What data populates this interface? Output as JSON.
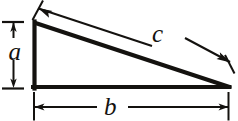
{
  "figure": {
    "kind": "geometry-diagram",
    "shape": "right-triangle",
    "background_color": "#ffffff",
    "ink_color": "#14120f",
    "labels": {
      "leg_vertical": "a",
      "leg_horizontal": "b",
      "hypotenuse": "c"
    },
    "dimension_lines": [
      {
        "name": "a-dimension",
        "label": "a",
        "orientation": "vertical",
        "arrowheads": "both-ends",
        "side": "left"
      },
      {
        "name": "b-dimension",
        "label": "b",
        "orientation": "horizontal",
        "arrowheads": "both-ends",
        "side": "bottom"
      },
      {
        "name": "c-dimension",
        "label": "c",
        "orientation": "diagonal",
        "arrowheads": "both-ends",
        "side": "above-hypotenuse"
      }
    ],
    "triangle": {
      "vertex_top_left": [
        34,
        22
      ],
      "vertex_bottom_left": [
        34,
        88
      ],
      "vertex_bottom_right": [
        229,
        88
      ]
    }
  }
}
